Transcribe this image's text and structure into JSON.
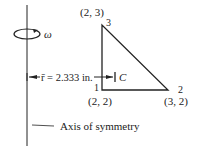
{
  "diagram": {
    "rotation_symbol": "ω",
    "nodes": [
      {
        "id": "1",
        "coord": "(2, 2)"
      },
      {
        "id": "2",
        "coord": "(3, 2)"
      },
      {
        "id": "3",
        "coord": "(2, 3)"
      }
    ],
    "dimension_label": "r̄ = 2.333 in.",
    "centroid_label": "C",
    "axis_label": "Axis of symmetry"
  }
}
